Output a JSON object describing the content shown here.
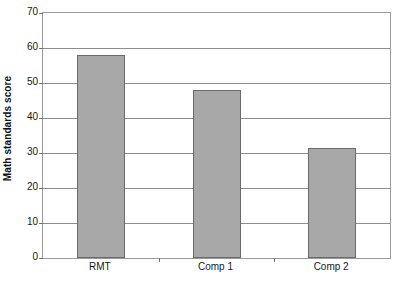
{
  "chart_data": {
    "type": "bar",
    "title": "",
    "subtitle": "",
    "categories": [
      "RMT",
      "Comp 1",
      "Comp 2"
    ],
    "values": [
      58,
      48,
      31.5
    ],
    "xlabel": "",
    "ylabel": "Math standards score",
    "ylim": [
      0,
      70
    ],
    "ytick_labels": [
      "0",
      "10",
      "20",
      "30",
      "40",
      "50",
      "60",
      "70"
    ],
    "ytick_values": [
      0,
      10,
      20,
      30,
      40,
      50,
      60,
      70
    ],
    "grid": "horizontal",
    "legend": "none",
    "bar_fill_color": "#a8a8a8",
    "bar_border_color": "#6a6a6a",
    "gridline_color": "#8d8d8d",
    "axis_color": "#9a9a9a",
    "background_color": "#ffffff"
  }
}
